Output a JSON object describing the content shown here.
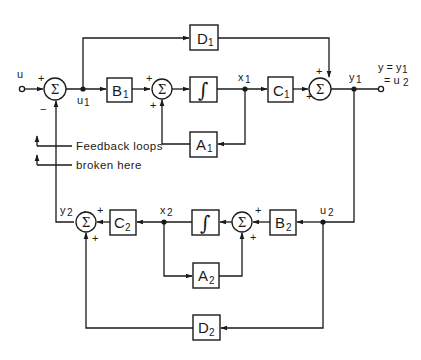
{
  "diagram": {
    "title": "",
    "input_label": "u",
    "output_label_line1": "y = y",
    "output_label_line1_sub": "1",
    "output_label_line2": "= u",
    "output_label_line2_sub": "2",
    "annotation_line1": "Feedback loops",
    "annotation_line2": "broken here",
    "summing_symbol": "Σ",
    "integrator_symbol": "∫",
    "blocks": {
      "B1": {
        "main": "B",
        "sub": "1"
      },
      "C1": {
        "main": "C",
        "sub": "1"
      },
      "D1": {
        "main": "D",
        "sub": "1"
      },
      "A1": {
        "main": "A",
        "sub": "1"
      },
      "B2": {
        "main": "B",
        "sub": "2"
      },
      "C2": {
        "main": "C",
        "sub": "2"
      },
      "D2": {
        "main": "D",
        "sub": "2"
      },
      "A2": {
        "main": "A",
        "sub": "2"
      }
    },
    "signals": {
      "u1": {
        "main": "u",
        "sub": "1"
      },
      "x1": {
        "main": "x",
        "sub": "1"
      },
      "y1": {
        "main": "y",
        "sub": "1"
      },
      "u2": {
        "main": "u",
        "sub": "2"
      },
      "x2": {
        "main": "x",
        "sub": "2"
      },
      "y2": {
        "main": "y",
        "sub": "2"
      }
    },
    "signs": {
      "sum_input_plus": "+",
      "sum_input_minus": "−",
      "sum1_a_plus": "+",
      "sum1_b_plus": "+",
      "sum_out1_top_plus": "+",
      "sum_out1_left_plus": "+",
      "sum2_a_plus": "+",
      "sum2_b_plus": "+",
      "sum_out2_top_plus": "+",
      "sum_out2_bottom_plus": "+"
    },
    "colors": {
      "ink": "#1a1a1a",
      "background": "#ffffff"
    }
  }
}
